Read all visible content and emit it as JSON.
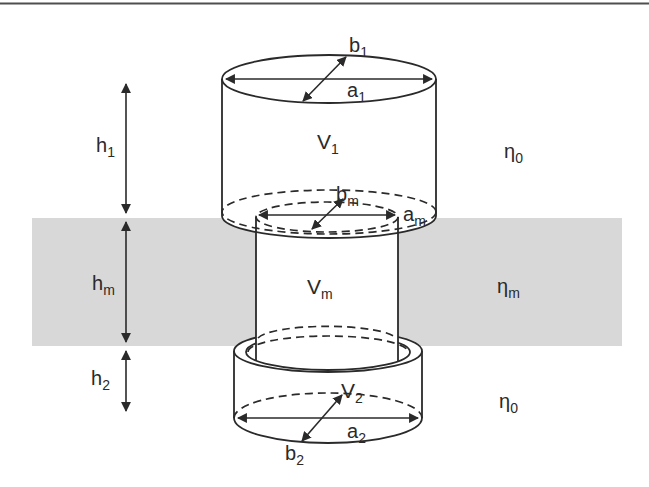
{
  "colors": {
    "background": "#ffffff",
    "band": "#d8d8d8",
    "line": "#2a2a2a",
    "top_rule": "#4f4f4f"
  },
  "labels": {
    "h1": {
      "base": "h",
      "sub": "1"
    },
    "hm": {
      "base": "h",
      "sub": "m"
    },
    "h2": {
      "base": "h",
      "sub": "2"
    },
    "b1": {
      "base": "b",
      "sub": "1"
    },
    "a1": {
      "base": "a",
      "sub": "1"
    },
    "V1": {
      "base": "V",
      "sub": "1"
    },
    "eta0_top": {
      "base": "η",
      "sub": "0"
    },
    "bm": {
      "base": "b",
      "sub": "m"
    },
    "am": {
      "base": "a",
      "sub": "m"
    },
    "Vm": {
      "base": "V",
      "sub": "m"
    },
    "eta_m": {
      "base": "η",
      "sub": "m"
    },
    "V2": {
      "base": "V",
      "sub": "2"
    },
    "a2": {
      "base": "a",
      "sub": "2"
    },
    "b2": {
      "base": "b",
      "sub": "2"
    },
    "eta0_bottom": {
      "base": "η",
      "sub": "0"
    }
  }
}
